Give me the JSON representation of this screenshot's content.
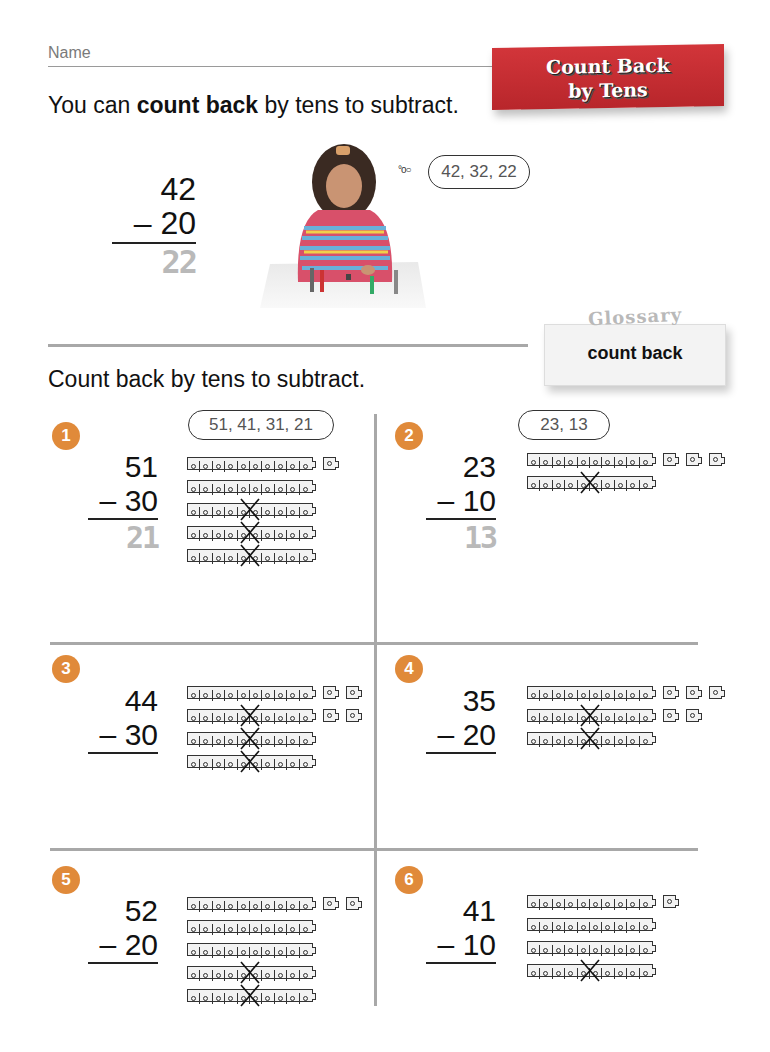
{
  "header": {
    "name_label": "Name",
    "banner_title_line1": "Count Back",
    "banner_title_line2": "by Tens",
    "banner_color": "#c62f34"
  },
  "intro": {
    "text_before": "You can ",
    "bold": "count back",
    "text_after": " by tens to subtract."
  },
  "example": {
    "top": "42",
    "subtract": "– 20",
    "answer": "22",
    "thought": "42, 32, 22",
    "thought_bubbles": "°o○",
    "photo_alt": "girl counting back with cube trains"
  },
  "glossary": {
    "tag": "Glossary",
    "term": "count back"
  },
  "instruction": "Count back by tens to subtract.",
  "problems": [
    {
      "number": "1",
      "top": "51",
      "subtract": "– 30",
      "answer": "21",
      "thought": "51, 41, 31, 21",
      "rods": 5,
      "ones_per_row": [
        1,
        0,
        0,
        0,
        0
      ],
      "crossed_rows": [
        2,
        3,
        4
      ]
    },
    {
      "number": "2",
      "top": "23",
      "subtract": "– 10",
      "answer": "13",
      "thought": "23, 13",
      "rods": 2,
      "ones_per_row": [
        3,
        0
      ],
      "crossed_rows": [
        1
      ]
    },
    {
      "number": "3",
      "top": "44",
      "subtract": "– 30",
      "answer": "",
      "thought": "",
      "rods": 4,
      "ones_per_row": [
        2,
        2,
        0,
        0
      ],
      "crossed_rows": [
        1,
        2,
        3
      ]
    },
    {
      "number": "4",
      "top": "35",
      "subtract": "– 20",
      "answer": "",
      "thought": "",
      "rods": 3,
      "ones_per_row": [
        3,
        2,
        0
      ],
      "crossed_rows": [
        1,
        2
      ]
    },
    {
      "number": "5",
      "top": "52",
      "subtract": "– 20",
      "answer": "",
      "thought": "",
      "rods": 5,
      "ones_per_row": [
        2,
        0,
        0,
        0,
        0
      ],
      "crossed_rows": [
        3,
        4
      ]
    },
    {
      "number": "6",
      "top": "41",
      "subtract": "– 10",
      "answer": "",
      "thought": "",
      "rods": 4,
      "ones_per_row": [
        1,
        0,
        0,
        0
      ],
      "crossed_rows": [
        3
      ]
    }
  ],
  "colors": {
    "number_circle": "#e08a3a",
    "grid_line": "#a8a8a8",
    "traced_answer": "#b9b9b9"
  }
}
